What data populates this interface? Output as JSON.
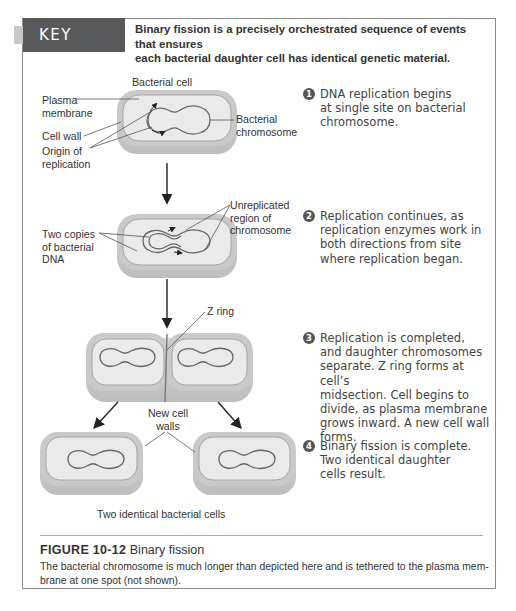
{
  "key_point": {
    "label": "KEY POINT",
    "text_line1": "Binary fission is a precisely orchestrated sequence of events that ensures",
    "text_line2": "each bacterial daughter cell has identical genetic material."
  },
  "diagram": {
    "labels": {
      "bacterial_cell": "Bacterial cell",
      "plasma_membrane_1": "Plasma",
      "plasma_membrane_2": "membrane",
      "cell_wall": "Cell wall",
      "origin_1": "Origin of",
      "origin_2": "replication",
      "bacterial_chromosome_1": "Bacterial",
      "bacterial_chromosome_2": "chromosome",
      "unreplicated_1": "Unreplicated",
      "unreplicated_2": "region of",
      "unreplicated_3": "chromosome",
      "two_copies_1": "Two copies",
      "two_copies_2": "of bacterial",
      "two_copies_3": "DNA",
      "z_ring": "Z ring",
      "new_cell_walls_1": "New cell",
      "new_cell_walls_2": "walls",
      "two_identical": "Two identical bacterial cells"
    }
  },
  "steps": [
    {
      "num": "1",
      "lines": [
        "DNA replication begins",
        "at single site on bacterial",
        "chromosome."
      ]
    },
    {
      "num": "2",
      "lines": [
        "Replication continues, as",
        "replication enzymes work in",
        "both directions from site",
        "where replication began."
      ]
    },
    {
      "num": "3",
      "lines": [
        "Replication is completed,",
        "and daughter chromosomes",
        "separate. Z ring forms at cell’s",
        "midsection. Cell begins to",
        "divide, as plasma membrane",
        "grows inward. A new cell wall",
        "forms."
      ]
    },
    {
      "num": "4",
      "lines": [
        "Binary fission is complete.",
        "Two identical daughter",
        "cells result."
      ]
    }
  ],
  "caption": {
    "figure_number": "FIGURE 10-12",
    "figure_title": "Binary fission",
    "body_line1": "The bacterial chromosome is much longer than depicted here and is tethered to the plasma mem-",
    "body_line2": "brane at one spot (not shown)."
  },
  "colors": {
    "header_bg": "#58595b",
    "tab": "#c8c8c8",
    "cell_wall": "#c9c9c9",
    "cell_inner": "#e9e9e9",
    "membrane": "#9a9a9a",
    "chromosome": "#666666",
    "frame_border": "#8a8a8a"
  }
}
